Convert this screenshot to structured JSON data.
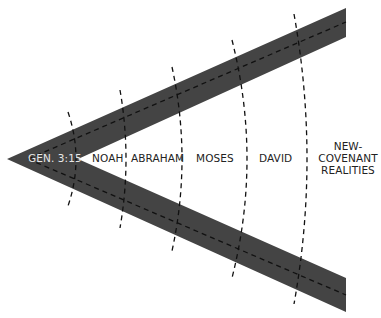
{
  "diagram": {
    "type": "covenant-wedge",
    "band_color": "#444444",
    "background": "#ffffff",
    "dash_color": "#111111",
    "label_color_inside": "#222222",
    "label_color_on_band": "#e6e6e6",
    "labels": {
      "origin": "GEN. 3:15",
      "stage1": "NOAH",
      "stage2": "ABRAHAM",
      "stage3": "MOSES",
      "stage4": "DAVID",
      "stage5_line1": "NEW-",
      "stage5_line2": "COVENANT",
      "stage5_line3": "REALITIES"
    },
    "stages": [
      "GEN. 3:15",
      "NOAH",
      "ABRAHAM",
      "MOSES",
      "DAVID",
      "NEW-COVENANT REALITIES"
    ]
  }
}
